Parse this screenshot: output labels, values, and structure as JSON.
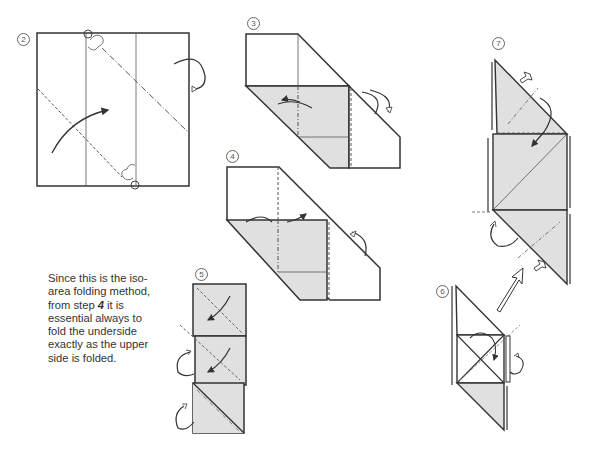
{
  "figure": {
    "type": "origami-instruction-diagram",
    "colors": {
      "paper_front": "#ffffff",
      "paper_back_shaded": "#e0e0e0",
      "line": "#333333"
    },
    "steps": [
      {
        "number": "2",
        "label": "②",
        "description": "Square with two vertical crease lines; valley fold along lower diagonal dashed line, mountain fold along upper dash-dot line; reference points circled at top and bottom edges"
      },
      {
        "number": "3",
        "label": "③",
        "description": "Folded strip shaped as a parallelogram; lower portion shaded; arrows indicate fold left and turn over"
      },
      {
        "number": "4",
        "label": "④",
        "description": "Similar parallelogram with shaded lower half; arrows indicate folding upper and underside"
      },
      {
        "number": "5",
        "label": "⑤",
        "description": "Vertical stack of three shaded squares with diagonal valley folds and arrows; underside folded identically"
      },
      {
        "number": "6",
        "label": "⑥",
        "description": "Parallelogram form with crossed diagonals in middle square; arrows showing fold; large arrow points to next step"
      },
      {
        "number": "7",
        "label": "⑦",
        "description": "Tall parallelogram with shaded triangles top and bottom and a shaded square center; push-in arrows at edges"
      }
    ],
    "note": {
      "line1": "Since this is the iso-",
      "line2": "area folding method,",
      "line3_pre": "from step ",
      "line3_step": "4",
      "line3_post": " it is",
      "line4": "essential always to",
      "line5": "fold the underside",
      "line6": "exactly as the upper",
      "line7": "side is folded."
    }
  }
}
